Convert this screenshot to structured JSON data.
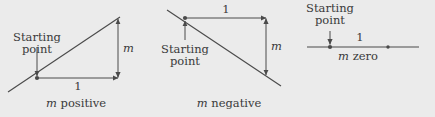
{
  "figure": {
    "background_color": "#ebebeb",
    "ink_color": "#4a4a4a",
    "text_color": "#3a3a3a",
    "panels": [
      {
        "id": "m-positive",
        "caption": "m positive",
        "caption_math": "m",
        "caption_rest": " positive",
        "starting_point_label_line1": "Starting",
        "starting_point_label_line2": "point",
        "run_label": "1",
        "rise_label": "m",
        "slope_sign": "positive"
      },
      {
        "id": "m-negative",
        "caption": "m negative",
        "caption_math": "m",
        "caption_rest": " negative",
        "starting_point_label_line1": "Starting",
        "starting_point_label_line2": "point",
        "run_label": "1",
        "rise_label": "m",
        "slope_sign": "negative"
      },
      {
        "id": "m-zero",
        "caption": "m zero",
        "caption_math": "m",
        "caption_rest": " zero",
        "starting_point_label_line1": "Starting",
        "starting_point_label_line2": "point",
        "run_label": "1",
        "rise_label": "",
        "slope_sign": "zero"
      }
    ]
  }
}
